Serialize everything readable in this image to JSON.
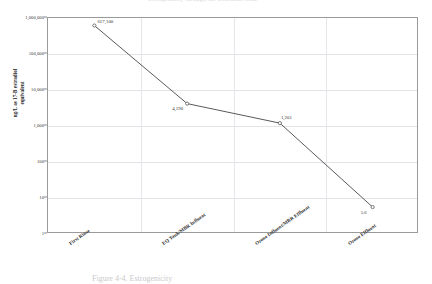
{
  "figure": {
    "top_partial_text": "Estrogenicity through the treatment train",
    "bottom_partial_caption": "Figure 4-4. Estrogenicity"
  },
  "axes": {
    "y_title": "ng/L as 17-B estradiol equivalent",
    "y_title_line1": "ng/L as 17-B estradiol",
    "y_title_line2": "equivalent",
    "y_tick_labels": [
      "1,000,000",
      "100,000",
      "10,000",
      "1,000",
      "100",
      "10",
      "1"
    ],
    "x_tick_labels": [
      "First Rinse",
      "EQ Tank/MBR Influent",
      "Ozone Influent/MBR Effluent",
      "Ozone Effluent"
    ]
  },
  "point_labels": [
    "617,100",
    "4,190",
    "1,201",
    "5.6"
  ],
  "colors": {
    "line": "#5a5a5a",
    "frame": "#9a9a9a",
    "grid": "#e3e3e8",
    "text": "#2b2b2b"
  },
  "chart_data": {
    "type": "line",
    "title": "",
    "xlabel": "",
    "ylabel": "ng/L as 17-B estradiol equivalent",
    "categories": [
      "First Rinse",
      "EQ Tank/MBR Influent",
      "Ozone Influent/MBR Effluent",
      "Ozone Effluent"
    ],
    "values": [
      617100,
      4190,
      1201,
      5.6
    ],
    "data_labels": [
      "617,100",
      "4,190",
      "1,201",
      "5.6"
    ],
    "yscale": "log",
    "ylim": [
      1,
      1000000
    ],
    "y_ticks": [
      1,
      10,
      100,
      1000,
      10000,
      100000,
      1000000
    ],
    "y_tick_labels": [
      "1",
      "10",
      "100",
      "1,000",
      "10,000",
      "100,000",
      "1,000,000"
    ],
    "grid": true,
    "legend": false,
    "markers": true,
    "line_color": "#5a5a5a"
  }
}
